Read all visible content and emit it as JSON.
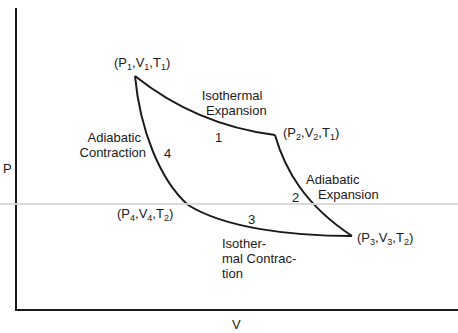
{
  "diagram": {
    "type": "PV diagram (Carnot cycle)",
    "axes": {
      "x_label": "V",
      "y_label": "P"
    },
    "states": [
      {
        "id": "state-1",
        "P": "P",
        "P_sub": "1",
        "V": "V",
        "V_sub": "1",
        "T": "T",
        "T_sub": "1"
      },
      {
        "id": "state-2",
        "P": "P",
        "P_sub": "2",
        "V": "V",
        "V_sub": "2",
        "T": "T",
        "T_sub": "1"
      },
      {
        "id": "state-3",
        "P": "P",
        "P_sub": "3",
        "V": "V",
        "V_sub": "3",
        "T": "T",
        "T_sub": "2"
      },
      {
        "id": "state-4",
        "P": "P",
        "P_sub": "4",
        "V": "V",
        "V_sub": "4",
        "T": "T",
        "T_sub": "2"
      }
    ],
    "processes": [
      {
        "number": "1",
        "line1": "Isothermal",
        "line2": "Expansion"
      },
      {
        "number": "2",
        "line1": "Adiabatic",
        "line2": "Expansion"
      },
      {
        "number": "3",
        "line1": "Isother-",
        "line2": "mal Contrac-",
        "line3": "tion"
      },
      {
        "number": "4",
        "line1": "Adiabatic",
        "line2": "Contraction"
      }
    ],
    "colors": {
      "stroke": "#1a1a1a",
      "background": "#ffffff",
      "scan_artifact": "#d6d6d6"
    }
  }
}
